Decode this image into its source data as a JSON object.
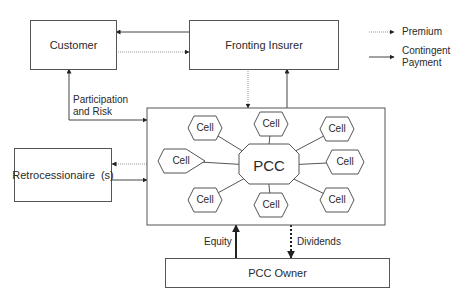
{
  "nodes": {
    "customer": "Customer",
    "fronting_insurer": "Fronting Insurer",
    "retrocessionaire": "Retrocessionaire  (s)",
    "pcc": "PCC",
    "pcc_owner": "PCC Owner",
    "cells": [
      "Cell",
      "Cell",
      "Cell",
      "Cell",
      "Cell",
      "Cell",
      "Cell",
      "Cell"
    ]
  },
  "edge_labels": {
    "participation_line1": "Participation",
    "participation_line2": "and Risk",
    "equity": "Equity",
    "dividends": "Dividends"
  },
  "legend": {
    "premium": "Premium",
    "contingent_line1": "Contingent",
    "contingent_line2": "Payment"
  },
  "colors": {
    "line": "#444444",
    "dotted": "#888888",
    "box_border": "#555555"
  }
}
